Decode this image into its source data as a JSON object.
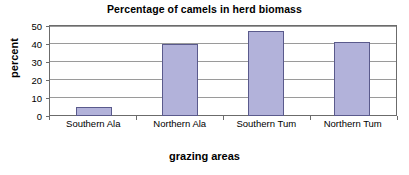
{
  "chart_data": {
    "type": "bar",
    "title": "Percentage of camels in herd biomass",
    "xlabel": "grazing areas",
    "ylabel": "percent",
    "categories": [
      "Southern Ala",
      "Northern Ala",
      "Southern Tum",
      "Northern Tum"
    ],
    "values": [
      5,
      40,
      47,
      41
    ],
    "ylim": [
      0,
      50
    ],
    "yticks": [
      0,
      10,
      20,
      30,
      40,
      50
    ],
    "ytick_labels": [
      "0",
      "10",
      "20",
      "30",
      "40",
      "50"
    ],
    "grid": "horizontal",
    "legend": "none",
    "series": [
      {
        "name": "percent",
        "values": [
          5,
          40,
          47,
          41
        ],
        "bar_fill": "#b2b2da",
        "bar_border": "#5a5a8c"
      }
    ]
  },
  "style": {
    "background": "#ffffff",
    "axis_color": "#6b6b6b",
    "gridline_color": "#9a9a9a",
    "text_color": "#000000"
  }
}
